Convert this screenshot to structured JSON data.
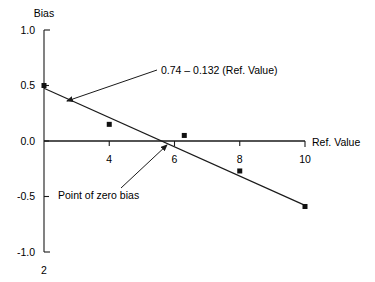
{
  "chart_data": {
    "type": "scatter",
    "title": "",
    "xlabel": "Ref. Value",
    "ylabel": "Bias",
    "xlim": [
      2,
      10
    ],
    "ylim": [
      -1.0,
      1.0
    ],
    "grid": false,
    "legend": "none",
    "x_ticks": [
      "2",
      "4",
      "6",
      "8",
      "10"
    ],
    "x_tick_values": [
      2,
      4,
      6,
      8,
      10
    ],
    "y_ticks": [
      "1.0",
      "0.5",
      "0.0",
      "-0.5",
      "-1.0"
    ],
    "y_tick_values": [
      1.0,
      0.5,
      0.0,
      -0.5,
      -1.0
    ],
    "points": [
      {
        "x": 2,
        "y": 0.5
      },
      {
        "x": 4,
        "y": 0.15
      },
      {
        "x": 6.3,
        "y": 0.05
      },
      {
        "x": 8,
        "y": -0.27
      },
      {
        "x": 10,
        "y": -0.59
      }
    ],
    "series": [
      {
        "name": "Bias",
        "x": [
          2,
          4,
          6.3,
          8,
          10
        ],
        "values": [
          0.5,
          0.15,
          0.05,
          -0.27,
          -0.59
        ]
      }
    ],
    "fit_line": {
      "intercept": 0.74,
      "slope": -0.132,
      "x_start": 2,
      "x_end": 10,
      "y_start": 0.476,
      "y_end": -0.58,
      "zero_crossing_x": 5.606
    },
    "annotations": [
      {
        "id": "regression-equation",
        "text": "0.74 – 0.132 (Ref. Value)",
        "label_x": 161,
        "label_y": 74,
        "arrow_from_x": 157,
        "arrow_from_y": 70,
        "arrow_to_x": 67,
        "arrow_to_y": 101
      },
      {
        "id": "zero-bias-note",
        "text": "Point of zero bias",
        "label_x": 58,
        "label_y": 199,
        "arrow_from_x": 121,
        "arrow_from_y": 188,
        "arrow_to_x": 167,
        "arrow_to_y": 145
      }
    ],
    "axis_titles": {
      "y": "Bias",
      "x": "Ref. Value"
    }
  },
  "geometry": {
    "y_axis_x": 44,
    "x_axis_y": 143,
    "y_top_px": 30,
    "y_bottom_px": 252,
    "x_right_px": 305,
    "tick_len": 5,
    "marker_size": 5
  }
}
